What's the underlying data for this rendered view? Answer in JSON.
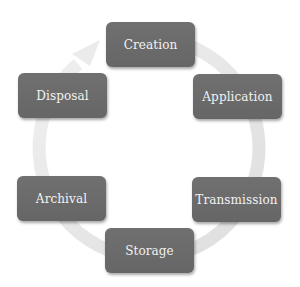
{
  "diagram": {
    "type": "cycle",
    "colors": {
      "box": "#6b6b6b",
      "text": "#f2f2f2",
      "ring": "#e4e4e4"
    },
    "stages": [
      {
        "label": "Creation"
      },
      {
        "label": "Application"
      },
      {
        "label": "Transmission"
      },
      {
        "label": "Storage"
      },
      {
        "label": "Archival"
      },
      {
        "label": "Disposal"
      }
    ]
  }
}
